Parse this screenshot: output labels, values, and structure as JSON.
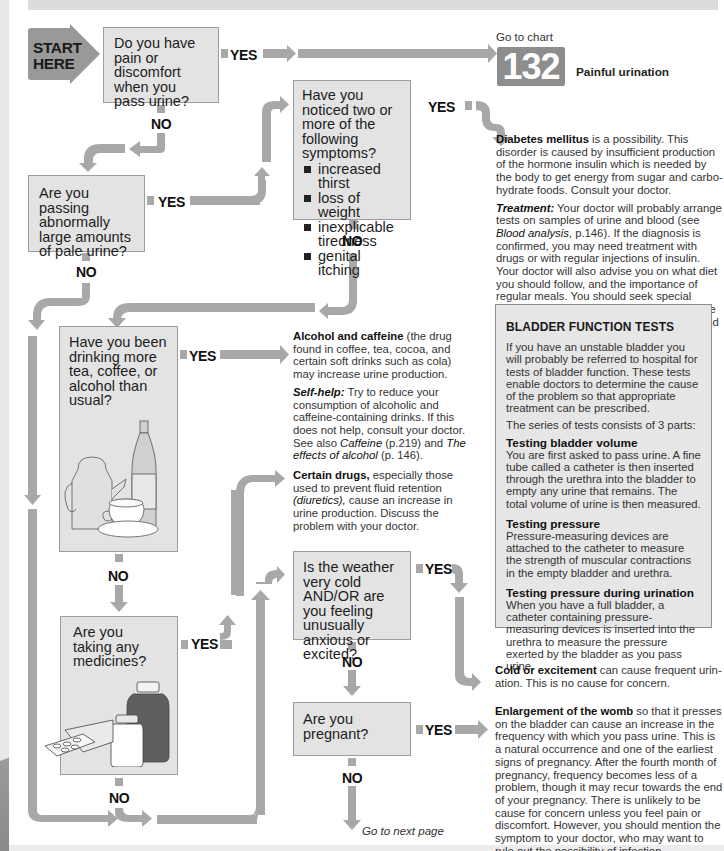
{
  "start": {
    "line1": "START",
    "line2": "HERE"
  },
  "colors": {
    "arrow": "#a8a8a8",
    "box_fill": "#e3e3e3",
    "box_border": "#9d9d9d",
    "badge": "#8d8d8d",
    "start_arrow": "#999999"
  },
  "questions": {
    "q1": {
      "text": "Do you have pain or discomfort when you pass urine?",
      "yes": "YES",
      "no": "NO"
    },
    "q2": {
      "text": "Are you passing abnormally large amounts of pale urine?",
      "yes": "YES",
      "no": "NO"
    },
    "q3": {
      "text": "Have you noticed two or more of the following symptoms?",
      "symptoms": [
        "increased thirst",
        "loss of weight",
        "inexplicable tiredness",
        "genital itching"
      ],
      "yes": "YES",
      "no": "NO"
    },
    "q4": {
      "text": "Have you been drinking more tea, coffee, or alcohol than usual?",
      "yes": "YES",
      "no": "NO"
    },
    "q5": {
      "text": "Are you taking any medicines?",
      "yes": "YES",
      "no": "NO"
    },
    "q6": {
      "text": "Is the weather very cold AND/OR are you feeling unusually anxious or excited?",
      "yes": "YES",
      "no": "NO"
    },
    "q7": {
      "text": "Are you pregnant?",
      "yes": "YES",
      "no": "NO"
    }
  },
  "goto_chart": {
    "label": "Go to chart",
    "number": "132",
    "title": "Painful urination"
  },
  "next_page": "Go to next page",
  "answers": {
    "diabetes": {
      "heading": "Diabetes mellitus",
      "body": " is a possibility. This disorder is caused by insufficient production of the hormone insulin which is needed by the body to get energy from sugar and carbo-hydrate foods. Consult your doctor.",
      "treatment_label": "Treatment:",
      "treatment_1": " Your doctor will probably arrange tests on samples of urine and blood (see ",
      "treatment_ref": "Blood analysis",
      "treatment_2": ", p.146). If the diagnosis is confirmed, you may need treatment with drugs or with regular injections of insulin. Your doctor will also advise you on what diet you should follow, and the importance of regular meals. You should seek special advice if you intend to have a baby because the disease carries risks for both mother and unborn baby."
    },
    "alcohol": {
      "heading": "Alcohol and caffeine",
      "body": " (the drug found in coffee, tea, cocoa, and certain soft drinks such as cola) may increase urine production.",
      "selfhelp_label": "Self-help:",
      "selfhelp_1": " Try to reduce your consumption of alcoholic and caffeine-containing drinks. If this does not help, consult your doctor. See also ",
      "ref1": "Caffeine",
      "selfhelp_2": " (p.219) and ",
      "ref2": "The effects of alcohol",
      "selfhelp_3": " (p. 146)."
    },
    "drugs": {
      "heading": "Certain drugs,",
      "body1": " especially those used to prevent fluid retention ",
      "term": "(diuretics),",
      "body2": " cause an increase in urine production. Discuss the problem with your doctor."
    },
    "cold": {
      "heading": "Cold or excitement",
      "body": " can cause frequent urin-ation. This is no cause for concern."
    },
    "womb": {
      "heading": "Enlargement of the womb",
      "body": " so that it presses on the bladder can cause an increase in the frequency with which you pass urine. This is a natural occurrence and one of the earliest signs of pregnancy. After the fourth month of pregnancy, frequency becomes less of a problem, though it may recur towards the end of your pregnancy. There is unlikely to be cause for concern unless you feel pain or discomfort. However, you should mention the symptom to your doctor, who may want to rule out the possibility of infection."
    }
  },
  "infobox": {
    "title": "BLADDER FUNCTION TESTS",
    "intro": "If you have an unstable bladder you will probably be referred to hospital for tests of bladder function. These tests enable doctors to determine the cause of the problem so that appropriate treatment can be prescribed.",
    "series": "The series of tests consists of 3 parts:",
    "sections": [
      {
        "title": "Testing bladder volume",
        "text": "You are first asked to pass urine. A fine tube called a catheter is then inserted through the urethra into the bladder to empty any urine that remains. The total volume of urine is then measured."
      },
      {
        "title": "Testing pressure",
        "text": "Pressure-measuring devices are attached to the catheter to measure the strength of muscular contractions in the empty bladder and urethra."
      },
      {
        "title": "Testing pressure during urination",
        "text": "When you have a full bladder, a catheter containing pressure-measuring devices is inserted into the urethra to measure the pressure exerted by the bladder as you pass urine."
      }
    ]
  }
}
